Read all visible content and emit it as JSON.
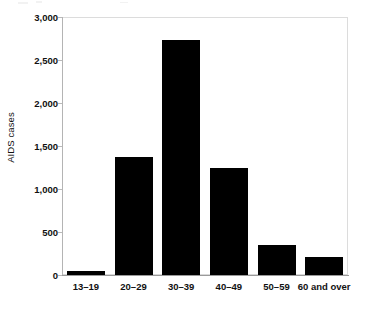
{
  "chart_data": {
    "type": "bar",
    "title": "",
    "subtitle": "",
    "xlabel": "",
    "ylabel": "AIDS cases",
    "categories": [
      "13–19",
      "20–29",
      "30–39",
      "40–49",
      "50–59",
      "60 and over"
    ],
    "values": [
      50,
      1370,
      2730,
      1245,
      345,
      215
    ],
    "series": [
      {
        "name": "AIDS cases",
        "values": [
          50,
          1370,
          2730,
          1245,
          345,
          215
        ],
        "color": "#000000"
      }
    ],
    "ylim": [
      0,
      3000
    ],
    "yticks": [
      0,
      500,
      1000,
      1500,
      2000,
      2500,
      3000
    ],
    "ytick_labels": [
      "0",
      "500",
      "1,000",
      "1,500",
      "2,000",
      "2,500",
      "3,000"
    ],
    "grid": false,
    "legend": false,
    "legend_position": "none",
    "bar_color": "#000000",
    "frame_color": "#d8d8d8",
    "axis_color": "#9a9a9a",
    "background": "#ffffff",
    "orientation": "vertical",
    "annotations": []
  }
}
